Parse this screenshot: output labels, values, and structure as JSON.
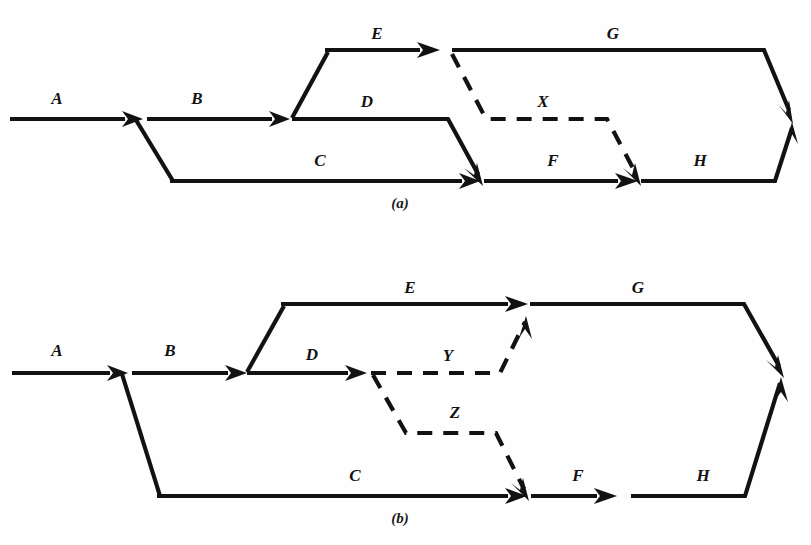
{
  "figure": {
    "background_color": "#fefefe",
    "ink_color": "#121212",
    "panels": [
      {
        "id": "panel-a",
        "caption": "(a)",
        "caption_x": 400,
        "caption_y": 205,
        "edges": [
          {
            "label": "A",
            "label_x": 57,
            "label_y": 100,
            "style": "solid"
          },
          {
            "label": "B",
            "label_x": 197,
            "label_y": 100,
            "style": "solid"
          },
          {
            "label": "C",
            "label_x": 320,
            "label_y": 162,
            "style": "solid"
          },
          {
            "label": "D",
            "label_x": 367,
            "label_y": 103,
            "style": "solid"
          },
          {
            "label": "E",
            "label_x": 377,
            "label_y": 35,
            "style": "solid"
          },
          {
            "label": "F",
            "label_x": 553,
            "label_y": 162,
            "style": "solid"
          },
          {
            "label": "G",
            "label_x": 613,
            "label_y": 35,
            "style": "solid"
          },
          {
            "label": "H",
            "label_x": 700,
            "label_y": 162,
            "style": "solid"
          },
          {
            "label": "X",
            "label_x": 543,
            "label_y": 103,
            "style": "dashed"
          }
        ]
      },
      {
        "id": "panel-b",
        "caption": "(b)",
        "caption_x": 400,
        "caption_y": 520,
        "edges": [
          {
            "label": "A",
            "label_x": 57,
            "label_y": 352,
            "style": "solid"
          },
          {
            "label": "B",
            "label_x": 170,
            "label_y": 352,
            "style": "solid"
          },
          {
            "label": "C",
            "label_x": 355,
            "label_y": 477,
            "style": "solid"
          },
          {
            "label": "D",
            "label_x": 312,
            "label_y": 356,
            "style": "solid"
          },
          {
            "label": "E",
            "label_x": 410,
            "label_y": 289,
            "style": "solid"
          },
          {
            "label": "F",
            "label_x": 578,
            "label_y": 477,
            "style": "solid"
          },
          {
            "label": "G",
            "label_x": 638,
            "label_y": 289,
            "style": "solid"
          },
          {
            "label": "H",
            "label_x": 703,
            "label_y": 477,
            "style": "solid"
          },
          {
            "label": "Y",
            "label_x": 448,
            "label_y": 357,
            "style": "dashed"
          },
          {
            "label": "Z",
            "label_x": 455,
            "label_y": 414,
            "style": "dashed"
          }
        ]
      }
    ]
  }
}
